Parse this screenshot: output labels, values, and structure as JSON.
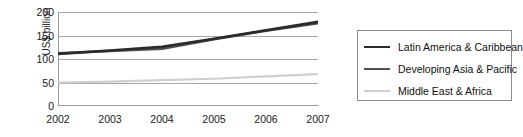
{
  "chart_data": {
    "type": "line",
    "title": "",
    "xlabel": "",
    "ylabel": "US$ billion",
    "x": [
      2002,
      2003,
      2004,
      2005,
      2006,
      2007
    ],
    "xtick_labels": [
      "2002",
      "2003",
      "2004",
      "2005",
      "2006",
      "2007"
    ],
    "ytick_labels": [
      "0",
      "50",
      "100",
      "150",
      "200"
    ],
    "yticks": [
      0,
      50,
      100,
      150,
      200
    ],
    "ylim": [
      0,
      200
    ],
    "xlim": [
      2002,
      2007
    ],
    "grid": true,
    "grid_axis": "y",
    "legend_position": "right",
    "series": [
      {
        "name": "Latin America & Caribbean",
        "color": "#2b2b2b",
        "values": [
          111,
          118,
          126,
          143,
          161,
          179
        ]
      },
      {
        "name": "Developing Asia & Pacific",
        "color": "#4f4f4f",
        "values": [
          112,
          117,
          122,
          142,
          160,
          176
        ]
      },
      {
        "name": "Middle East & Africa",
        "color": "#cfcfcf",
        "values": [
          50,
          52,
          55,
          58,
          63,
          68
        ]
      }
    ]
  },
  "legend": {
    "items": [
      {
        "label": "Latin America & Caribbean",
        "color": "#2b2b2b"
      },
      {
        "label": "Developing Asia & Pacific",
        "color": "#4f4f4f"
      },
      {
        "label": "Middle East & Africa",
        "color": "#cfcfcf"
      }
    ]
  },
  "axes": {
    "y_axis_title": "US$ billion"
  }
}
